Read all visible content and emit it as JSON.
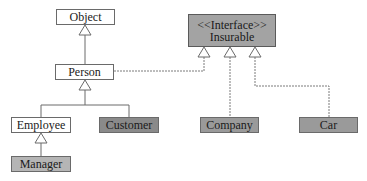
{
  "diagram": {
    "type": "UML class diagram",
    "classes": {
      "object": {
        "label": "Object",
        "fill": "#ffffff"
      },
      "person": {
        "label": "Person",
        "fill": "#ffffff"
      },
      "employee": {
        "label": "Employee",
        "fill": "#ffffff"
      },
      "customer": {
        "label": "Customer",
        "fill": "#8a8a8a"
      },
      "manager": {
        "label": "Manager",
        "fill": "#b5b5b5"
      },
      "company": {
        "label": "Company",
        "fill": "#9a9a9a"
      },
      "car": {
        "label": "Car",
        "fill": "#9a9a9a"
      }
    },
    "interface": {
      "stereotype": "<<Interface>>",
      "label": "Insurable",
      "fill": "#a3a3a3"
    },
    "relationships": [
      {
        "from": "Person",
        "to": "Object",
        "kind": "inheritance"
      },
      {
        "from": "Employee",
        "to": "Person",
        "kind": "inheritance"
      },
      {
        "from": "Customer",
        "to": "Person",
        "kind": "inheritance"
      },
      {
        "from": "Manager",
        "to": "Employee",
        "kind": "inheritance"
      },
      {
        "from": "Person",
        "to": "Insurable",
        "kind": "realization"
      },
      {
        "from": "Company",
        "to": "Insurable",
        "kind": "realization"
      },
      {
        "from": "Car",
        "to": "Insurable",
        "kind": "realization"
      }
    ]
  }
}
